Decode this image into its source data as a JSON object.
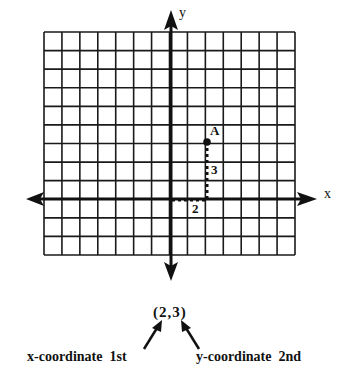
{
  "diagram": {
    "grid": {
      "left": 44,
      "top": 32,
      "right": 295,
      "bottom": 255,
      "columns": 14,
      "rows": 12,
      "origin_col": 7,
      "origin_row": 9,
      "line_color": "#1a1a1a"
    },
    "axes": {
      "x_label": "x",
      "y_label": "y",
      "color": "#111111"
    },
    "point": {
      "label": "A",
      "x": 2,
      "y": 3
    },
    "guides": {
      "horizontal_label": "2",
      "vertical_label": "3"
    },
    "ordered_pair": "(2,3)",
    "captions": {
      "x_caption": "x-coordinate  1st",
      "y_caption": "y-coordinate  2nd"
    }
  }
}
